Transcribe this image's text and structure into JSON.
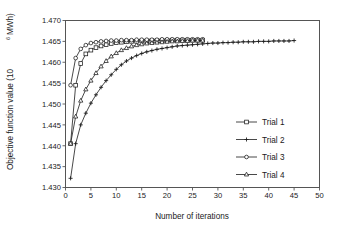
{
  "chart_data": {
    "type": "line",
    "title": "",
    "xlabel": "Number of iterations",
    "ylabel": "Objective function value (10⁶ MWh)",
    "ylabel_base": "Objective function value (10",
    "ylabel_sup": "6",
    "ylabel_tail": " MWh)",
    "xlim": [
      0,
      50
    ],
    "ylim": [
      1.43,
      1.47
    ],
    "xticks": [
      0,
      5,
      10,
      15,
      20,
      25,
      30,
      35,
      40,
      45,
      50
    ],
    "yticks": [
      1.43,
      1.435,
      1.44,
      1.445,
      1.45,
      1.455,
      1.46,
      1.465,
      1.47
    ],
    "ytick_labels": [
      "1.430",
      "1.435",
      "1.440",
      "1.445",
      "1.450",
      "1.455",
      "1.460",
      "1.465",
      "1.470"
    ],
    "xtick_labels": [
      "0",
      "5",
      "10",
      "15",
      "20",
      "25",
      "30",
      "35",
      "40",
      "45",
      "50"
    ],
    "grid": false,
    "legend_position": "center-right",
    "axis_color": "#555555",
    "line_color": "#1a1a1a",
    "series": [
      {
        "name": "Trial 1",
        "marker": "square-open",
        "x": [
          1,
          2,
          3,
          4,
          5,
          6,
          7,
          8,
          9,
          10,
          11,
          12,
          13,
          14,
          15,
          16,
          17,
          18,
          19,
          20,
          21,
          22,
          23,
          24,
          25,
          26,
          27
        ],
        "values": [
          1.4405,
          1.4545,
          1.4597,
          1.462,
          1.4629,
          1.4635,
          1.4639,
          1.4642,
          1.4645,
          1.4647,
          1.4648,
          1.4649,
          1.465,
          1.465,
          1.4651,
          1.4651,
          1.4652,
          1.4652,
          1.4652,
          1.4652,
          1.4653,
          1.4653,
          1.4653,
          1.4653,
          1.4653,
          1.4653,
          1.4653
        ]
      },
      {
        "name": "Trial 2",
        "marker": "plus",
        "x": [
          1,
          2,
          3,
          4,
          5,
          6,
          7,
          8,
          9,
          10,
          11,
          12,
          13,
          14,
          15,
          16,
          17,
          18,
          19,
          20,
          21,
          22,
          23,
          24,
          25,
          26,
          27,
          28,
          29,
          30,
          31,
          32,
          33,
          34,
          35,
          36,
          37,
          38,
          39,
          40,
          41,
          42,
          43,
          44,
          45
        ],
        "values": [
          1.4322,
          1.4405,
          1.445,
          1.4478,
          1.4502,
          1.4522,
          1.454,
          1.4556,
          1.457,
          1.4583,
          1.4594,
          1.4603,
          1.461,
          1.4616,
          1.4621,
          1.4625,
          1.4628,
          1.4631,
          1.4633,
          1.4635,
          1.4637,
          1.4639,
          1.464,
          1.4641,
          1.4642,
          1.4643,
          1.4644,
          1.4645,
          1.4646,
          1.4646,
          1.4647,
          1.4647,
          1.4648,
          1.4648,
          1.4649,
          1.4649,
          1.4649,
          1.465,
          1.465,
          1.465,
          1.4651,
          1.4651,
          1.4651,
          1.4651,
          1.4652
        ]
      },
      {
        "name": "Trial 3",
        "marker": "circle-open",
        "x": [
          1,
          2,
          3,
          4,
          5,
          6,
          7,
          8,
          9,
          10,
          11,
          12,
          13,
          14,
          15,
          16,
          17,
          18,
          19,
          20,
          21,
          22,
          23,
          24,
          25,
          26,
          27
        ],
        "values": [
          1.4545,
          1.461,
          1.4632,
          1.4641,
          1.4646,
          1.4648,
          1.465,
          1.4651,
          1.4652,
          1.4652,
          1.4653,
          1.4653,
          1.4653,
          1.4654,
          1.4654,
          1.4654,
          1.4654,
          1.4654,
          1.4655,
          1.4655,
          1.4655,
          1.4655,
          1.4655,
          1.4655,
          1.4655,
          1.4655,
          1.4655
        ]
      },
      {
        "name": "Trial 4",
        "marker": "triangle-open",
        "x": [
          1,
          2,
          3,
          4,
          5,
          6,
          7,
          8,
          9,
          10,
          11,
          12,
          13,
          14,
          15,
          16,
          17,
          18,
          19,
          20,
          21,
          22,
          23,
          24,
          25,
          26,
          27
        ],
        "values": [
          1.4405,
          1.447,
          1.4508,
          1.4535,
          1.4556,
          1.4574,
          1.459,
          1.4603,
          1.4614,
          1.4622,
          1.4629,
          1.4634,
          1.4638,
          1.4641,
          1.4643,
          1.4645,
          1.4646,
          1.4647,
          1.4648,
          1.4649,
          1.465,
          1.465,
          1.4651,
          1.4651,
          1.4652,
          1.4652,
          1.4652
        ]
      }
    ]
  }
}
